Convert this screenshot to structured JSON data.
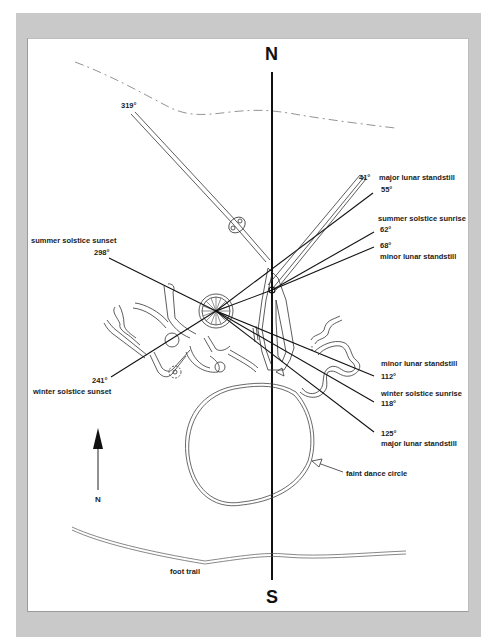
{
  "figure": {
    "type": "petroglyph alignment diagram",
    "cardinal": {
      "north": "N",
      "south": "S"
    },
    "north_arrow_label": "N",
    "azimuths": [
      {
        "id": "a319",
        "degrees": "319°",
        "label": ""
      },
      {
        "id": "a41",
        "degrees": "41°",
        "label": "major lunar standstill"
      },
      {
        "id": "a55",
        "degrees": "55°",
        "label": ""
      },
      {
        "id": "a62",
        "degrees": "62°",
        "label": "summer solstice sunrise"
      },
      {
        "id": "a68",
        "degrees": "68°",
        "label": "minor lunar standstill"
      },
      {
        "id": "a112",
        "degrees": "112°",
        "label": "minor lunar standstill"
      },
      {
        "id": "a118",
        "degrees": "118°",
        "label": "winter solstice sunrise"
      },
      {
        "id": "a125",
        "degrees": "125°",
        "label": "major lunar standstill"
      },
      {
        "id": "a241",
        "degrees": "241°",
        "label": "winter solstice sunset"
      },
      {
        "id": "a298",
        "degrees": "298°",
        "label": "summer solstice sunset"
      }
    ],
    "annotations": {
      "dance_circle": "faint dance circle",
      "foot_trail": "foot trail"
    },
    "colors": {
      "frame": "#c9c9c9",
      "panel": "#ffffff",
      "ink": "#111111",
      "outline": "#333333"
    }
  }
}
